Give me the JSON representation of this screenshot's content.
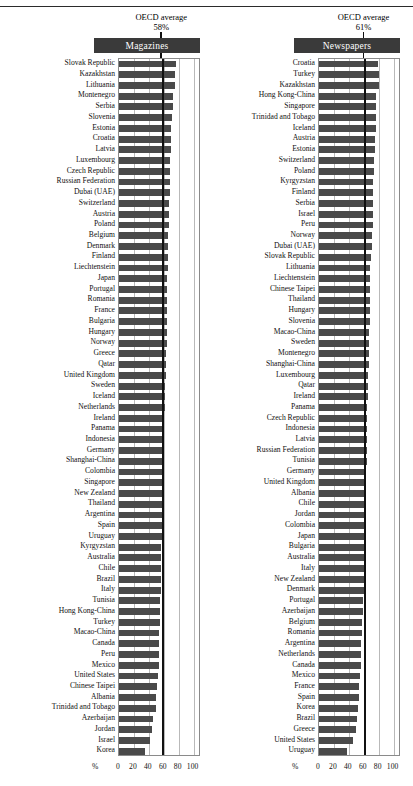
{
  "chart_data": {
    "type": "bar",
    "title": "",
    "xlabel": "%",
    "ylabel": "",
    "xlim": [
      0,
      110
    ],
    "grid": true,
    "orientation": "horizontal",
    "ticks": [
      "0",
      "20",
      "40",
      "60",
      "80",
      "100"
    ],
    "tick_values": [
      0,
      20,
      40,
      60,
      80,
      100
    ],
    "panels": [
      {
        "id": "magazines",
        "title": "Magazines",
        "average_label": "OECD average",
        "average_value": "58%",
        "average_number": 58,
        "categories": [
          "Slovak Republic",
          "Kazakhstan",
          "Lithuania",
          "Montenegro",
          "Serbia",
          "Slovenia",
          "Estonia",
          "Croatia",
          "Latvia",
          "Luxembourg",
          "Czech Republic",
          "Russian Federation",
          "Dubai (UAE)",
          "Switzerland",
          "Austria",
          "Poland",
          "Belgium",
          "Denmark",
          "Finland",
          "Liechtenstein",
          "Japan",
          "Portugal",
          "Romania",
          "France",
          "Bulgaria",
          "Hungary",
          "Norway",
          "Greece",
          "Qatar",
          "United Kingdom",
          "Sweden",
          "Iceland",
          "Netherlands",
          "Ireland",
          "Panama",
          "Indonesia",
          "Germany",
          "Shanghai-China",
          "Colombia",
          "Singapore",
          "New Zealand",
          "Thailand",
          "Argentina",
          "Spain",
          "Uruguay",
          "Kyrgyzstan",
          "Australia",
          "Chile",
          "Brazil",
          "Italy",
          "Tunisia",
          "Hong Kong-China",
          "Turkey",
          "Macao-China",
          "Canada",
          "Peru",
          "Mexico",
          "United States",
          "Chinese Taipei",
          "Albania",
          "Trinidad and Tobago",
          "Azerbaijan",
          "Jordan",
          "Israel",
          "Korea"
        ],
        "values": [
          76,
          75,
          75,
          72,
          72,
          71,
          70,
          70,
          70,
          69,
          69,
          68,
          68,
          67,
          67,
          67,
          66,
          66,
          66,
          66,
          65,
          65,
          65,
          64,
          64,
          64,
          64,
          63,
          63,
          63,
          62,
          62,
          62,
          61,
          61,
          61,
          60,
          60,
          60,
          59,
          59,
          59,
          58,
          58,
          58,
          57,
          57,
          56,
          56,
          56,
          55,
          55,
          55,
          54,
          54,
          53,
          53,
          52,
          51,
          50,
          49,
          46,
          44,
          41,
          35
        ]
      },
      {
        "id": "newspapers",
        "title": "Newspapers",
        "average_label": "OECD average",
        "average_value": "61%",
        "average_number": 61,
        "categories": [
          "Croatia",
          "Turkey",
          "Kazakhstan",
          "Hong Kong-China",
          "Singapore",
          "Trinidad and Tobago",
          "Iceland",
          "Austria",
          "Estonia",
          "Switzerland",
          "Poland",
          "Kyrgyzstan",
          "Finland",
          "Serbia",
          "Israel",
          "Peru",
          "Norway",
          "Dubai (UAE)",
          "Slovak Republic",
          "Lithuania",
          "Liechtenstein",
          "Chinese Taipei",
          "Thailand",
          "Hungary",
          "Slovenia",
          "Macao-China",
          "Sweden",
          "Montenegro",
          "Shanghai-China",
          "Luxembourg",
          "Qatar",
          "Ireland",
          "Panama",
          "Czech Republic",
          "Indonesia",
          "Latvia",
          "Russian Federation",
          "Tunisia",
          "Germany",
          "United Kingdom",
          "Albania",
          "Chile",
          "Jordan",
          "Colombia",
          "Japan",
          "Bulgaria",
          "Australia",
          "Italy",
          "New Zealand",
          "Denmark",
          "Portugal",
          "Azerbaijan",
          "Belgium",
          "Romania",
          "Argentina",
          "Netherlands",
          "Canada",
          "Mexico",
          "France",
          "Spain",
          "Korea",
          "Brazil",
          "Greece",
          "United States",
          "Uruguay"
        ],
        "values": [
          79,
          80,
          81,
          77,
          77,
          77,
          76,
          75,
          75,
          74,
          74,
          73,
          73,
          73,
          72,
          72,
          71,
          71,
          70,
          69,
          69,
          69,
          68,
          68,
          68,
          67,
          67,
          67,
          67,
          66,
          66,
          66,
          65,
          65,
          65,
          64,
          64,
          64,
          63,
          63,
          62,
          62,
          62,
          62,
          61,
          61,
          61,
          60,
          60,
          60,
          59,
          59,
          58,
          58,
          57,
          57,
          56,
          55,
          54,
          53,
          52,
          51,
          49,
          46,
          38
        ]
      }
    ]
  }
}
